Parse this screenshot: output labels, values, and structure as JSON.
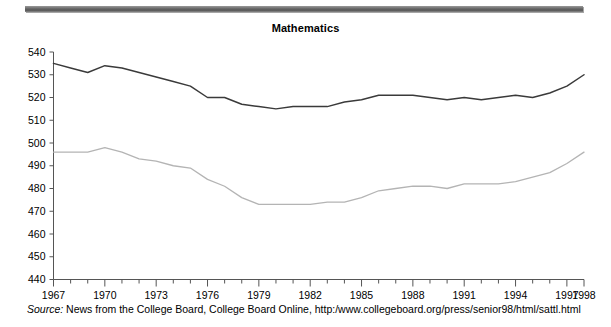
{
  "figure": {
    "title": "Mathematics",
    "source_label": "Source:",
    "source_text": "News from the College Board, College Board Online, http:/www.collegeboard.org/press/senior98/html/sattl.html"
  },
  "chart_data": {
    "type": "line",
    "title": "Mathematics",
    "xlabel": "",
    "ylabel": "",
    "xlim": [
      1967,
      1998
    ],
    "ylim": [
      440,
      540
    ],
    "ytick_step": 10,
    "yticks": [
      440,
      450,
      460,
      470,
      480,
      490,
      500,
      510,
      520,
      530,
      540
    ],
    "xticks": [
      1967,
      1968,
      1969,
      1970,
      1971,
      1972,
      1973,
      1974,
      1975,
      1976,
      1977,
      1978,
      1979,
      1980,
      1981,
      1982,
      1983,
      1984,
      1985,
      1986,
      1987,
      1988,
      1989,
      1990,
      1991,
      1992,
      1993,
      1994,
      1995,
      1996,
      1997,
      1998
    ],
    "xtick_labels_shown": [
      "1967",
      "1970",
      "1973",
      "1976",
      "1979",
      "1982",
      "1985",
      "1988",
      "1991",
      "1994",
      "1997",
      "1998"
    ],
    "grid": false,
    "legend": "none",
    "x": [
      1967,
      1968,
      1969,
      1970,
      1971,
      1972,
      1973,
      1974,
      1975,
      1976,
      1977,
      1978,
      1979,
      1980,
      1981,
      1982,
      1983,
      1984,
      1985,
      1986,
      1987,
      1988,
      1989,
      1990,
      1991,
      1992,
      1993,
      1994,
      1995,
      1996,
      1997,
      1998
    ],
    "series": [
      {
        "name": "upper-series",
        "color": "#3a3a3a",
        "values": [
          535,
          533,
          531,
          534,
          533,
          531,
          529,
          527,
          525,
          520,
          520,
          517,
          516,
          515,
          516,
          516,
          516,
          518,
          519,
          521,
          521,
          521,
          520,
          519,
          520,
          519,
          520,
          521,
          520,
          522,
          525,
          530
        ]
      },
      {
        "name": "lower-series",
        "color": "#b4b4b4",
        "values": [
          496,
          496,
          496,
          498,
          496,
          493,
          492,
          490,
          489,
          484,
          481,
          476,
          473,
          473,
          473,
          473,
          474,
          474,
          476,
          479,
          480,
          481,
          481,
          480,
          482,
          482,
          482,
          483,
          485,
          487,
          491,
          496
        ]
      }
    ]
  }
}
